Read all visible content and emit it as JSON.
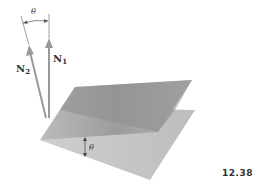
{
  "figure": {
    "number": "12.38",
    "angle_label_top": "θ",
    "angle_label_planes": "θ",
    "normal_1": {
      "symbol": "N",
      "subscript": "1"
    },
    "normal_2": {
      "symbol": "N",
      "subscript": "2"
    }
  },
  "colors": {
    "plane_top": "#9a9a9a",
    "plane_bottom": "#c2c2c2",
    "plane_overlap": "#8a8a8a",
    "arrow": "#9a9a9a",
    "text": "#333333"
  }
}
